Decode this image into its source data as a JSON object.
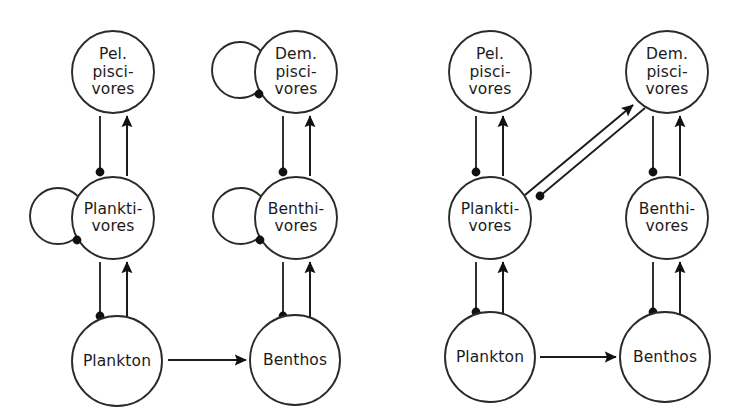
{
  "figure": {
    "kind": "food-web-diagram",
    "stroke_color": "#1b1b1b",
    "node_fill": "#ffffff",
    "background": "#ffffff"
  },
  "panels": [
    {
      "id": "a",
      "label": "(a)",
      "label_x": 44,
      "label_y": 25,
      "nodes": [
        {
          "id": "a-pel-pisc",
          "name": "pelagic-piscivores",
          "lines": [
            "Pel.",
            "pisci-",
            "vores"
          ],
          "cx": 113,
          "cy": 72,
          "r": 41,
          "self_loop": false
        },
        {
          "id": "a-dem-pisc",
          "name": "demersal-piscivores",
          "lines": [
            "Dem.",
            "pisci-",
            "vores"
          ],
          "cx": 296,
          "cy": 72,
          "r": 41,
          "self_loop": true,
          "loop_cx": 240,
          "loop_cy": 70,
          "loop_r": 28,
          "loop_dot_x": 259,
          "loop_dot_y": 94
        },
        {
          "id": "a-plankti",
          "name": "planktivores",
          "lines": [
            "Plankti-",
            "vores"
          ],
          "cx": 113,
          "cy": 218,
          "r": 41,
          "self_loop": true,
          "loop_cx": 58,
          "loop_cy": 216,
          "loop_r": 28,
          "loop_dot_x": 77,
          "loop_dot_y": 240
        },
        {
          "id": "a-benthi",
          "name": "benthivores",
          "lines": [
            "Benthi-",
            "vores"
          ],
          "cx": 296,
          "cy": 218,
          "r": 41,
          "self_loop": true,
          "loop_cx": 241,
          "loop_cy": 216,
          "loop_r": 28,
          "loop_dot_x": 260,
          "loop_dot_y": 240
        },
        {
          "id": "a-plankton",
          "name": "plankton",
          "lines": [
            "Plankton"
          ],
          "cx": 117,
          "cy": 361,
          "r": 45,
          "self_loop": false
        },
        {
          "id": "a-benthos",
          "name": "benthos",
          "lines": [
            "Benthos"
          ],
          "cx": 295,
          "cy": 360,
          "r": 45,
          "self_loop": false
        }
      ],
      "edges": [
        {
          "name": "planktivores-to-pel-piscivores-flow",
          "type": "arrow",
          "x1": 127,
          "y1": 176,
          "x2": 127,
          "y2": 116
        },
        {
          "name": "pel-piscivores-to-planktivores-control",
          "type": "dot",
          "x1": 100,
          "y1": 116,
          "x2": 100,
          "y2": 172
        },
        {
          "name": "benthivores-to-dem-piscivores-flow",
          "type": "arrow",
          "x1": 310,
          "y1": 176,
          "x2": 310,
          "y2": 116
        },
        {
          "name": "dem-piscivores-to-benthivores-control",
          "type": "dot",
          "x1": 283,
          "y1": 116,
          "x2": 283,
          "y2": 172
        },
        {
          "name": "plankton-to-planktivores-flow",
          "type": "arrow",
          "x1": 127,
          "y1": 320,
          "x2": 127,
          "y2": 262
        },
        {
          "name": "planktivores-to-plankton-control",
          "type": "dot",
          "x1": 100,
          "y1": 262,
          "x2": 100,
          "y2": 316
        },
        {
          "name": "benthos-to-benthivores-flow",
          "type": "arrow",
          "x1": 310,
          "y1": 320,
          "x2": 310,
          "y2": 262
        },
        {
          "name": "benthivores-to-benthos-control",
          "type": "dot",
          "x1": 283,
          "y1": 262,
          "x2": 283,
          "y2": 316
        },
        {
          "name": "plankton-to-benthos-flow",
          "type": "arrow",
          "x1": 168,
          "y1": 360,
          "x2": 246,
          "y2": 360
        }
      ]
    },
    {
      "id": "b",
      "label": "(b)",
      "label_x": 414,
      "label_y": 25,
      "nodes": [
        {
          "id": "b-pel-pisc",
          "name": "pelagic-piscivores",
          "lines": [
            "Pel.",
            "pisci-",
            "vores"
          ],
          "cx": 490,
          "cy": 72,
          "r": 41,
          "self_loop": false
        },
        {
          "id": "b-dem-pisc",
          "name": "demersal-piscivores",
          "lines": [
            "Dem.",
            "pisci-",
            "vores"
          ],
          "cx": 667,
          "cy": 72,
          "r": 41,
          "self_loop": false
        },
        {
          "id": "b-plankti",
          "name": "planktivores",
          "lines": [
            "Plankti-",
            "vores"
          ],
          "cx": 490,
          "cy": 218,
          "r": 41,
          "self_loop": false
        },
        {
          "id": "b-benthi",
          "name": "benthivores",
          "lines": [
            "Benthi-",
            "vores"
          ],
          "cx": 667,
          "cy": 218,
          "r": 41,
          "self_loop": false
        },
        {
          "id": "b-plankton",
          "name": "plankton",
          "lines": [
            "Plankton"
          ],
          "cx": 490,
          "cy": 357,
          "r": 45,
          "self_loop": false
        },
        {
          "id": "b-benthos",
          "name": "benthos",
          "lines": [
            "Benthos"
          ],
          "cx": 665,
          "cy": 357,
          "r": 45,
          "self_loop": false
        }
      ],
      "edges": [
        {
          "name": "planktivores-to-pel-piscivores-flow",
          "type": "arrow",
          "x1": 503,
          "y1": 176,
          "x2": 503,
          "y2": 116
        },
        {
          "name": "pel-piscivores-to-planktivores-control",
          "type": "dot",
          "x1": 476,
          "y1": 116,
          "x2": 476,
          "y2": 172
        },
        {
          "name": "benthivores-to-dem-piscivores-flow",
          "type": "arrow",
          "x1": 680,
          "y1": 176,
          "x2": 680,
          "y2": 116
        },
        {
          "name": "dem-piscivores-to-benthivores-control",
          "type": "dot",
          "x1": 653,
          "y1": 116,
          "x2": 653,
          "y2": 172
        },
        {
          "name": "plankton-to-planktivores-flow",
          "type": "arrow",
          "x1": 503,
          "y1": 316,
          "x2": 503,
          "y2": 262
        },
        {
          "name": "planktivores-to-plankton-control",
          "type": "dot",
          "x1": 476,
          "y1": 262,
          "x2": 476,
          "y2": 312
        },
        {
          "name": "benthos-to-benthivores-flow",
          "type": "arrow",
          "x1": 680,
          "y1": 316,
          "x2": 680,
          "y2": 262
        },
        {
          "name": "benthivores-to-benthos-control",
          "type": "dot",
          "x1": 653,
          "y1": 262,
          "x2": 653,
          "y2": 312
        },
        {
          "name": "plankton-to-benthos-flow",
          "type": "arrow",
          "x1": 540,
          "y1": 357,
          "x2": 616,
          "y2": 357
        },
        {
          "name": "planktivores-to-dem-piscivores-flow",
          "type": "arrow",
          "x1": 525,
          "y1": 195,
          "x2": 633,
          "y2": 105
        },
        {
          "name": "dem-piscivores-to-planktivores-control",
          "type": "dot",
          "x1": 645,
          "y1": 108,
          "x2": 540,
          "y2": 196
        }
      ]
    }
  ]
}
